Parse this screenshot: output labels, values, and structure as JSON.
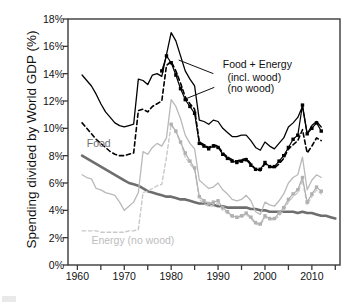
{
  "chart_data": {
    "type": "line",
    "title": "",
    "xlabel": "",
    "ylabel": "Spending divided by World GDP (%)",
    "xlim": [
      1958,
      2016
    ],
    "ylim": [
      0,
      18
    ],
    "y_tick_labels": [
      "0%",
      "2%",
      "4%",
      "6%",
      "8%",
      "10%",
      "12%",
      "14%",
      "16%",
      "18%"
    ],
    "y_tick_values": [
      0,
      2,
      4,
      6,
      8,
      10,
      12,
      14,
      16,
      18
    ],
    "x_tick_labels": [
      "1960",
      "1970",
      "1980",
      "1990",
      "2000",
      "2010"
    ],
    "x_tick_values": [
      1960,
      1970,
      1980,
      1990,
      2000,
      2010
    ],
    "x_minor_tick_values": [
      1965,
      1975,
      1985,
      1995,
      2005,
      2015
    ],
    "grid": false,
    "legend": "annotations-inline",
    "annotations": [
      {
        "name": "food-energy-title",
        "text": "Food + Energy",
        "x": 1991,
        "y": 14.6
      },
      {
        "name": "food-energy-incl-wood",
        "text": "(incl. wood)",
        "x": 1992,
        "y": 13.7
      },
      {
        "name": "food-energy-no-wood",
        "text": "(no wood)",
        "x": 1992,
        "y": 12.9
      },
      {
        "name": "food-label",
        "text": "Food",
        "x": 1962,
        "y": 8.9
      },
      {
        "name": "energy-no-wood-label",
        "text": "Energy (no wood)",
        "x": 1963,
        "y": 1.85
      }
    ],
    "series": [
      {
        "name": "Food + Energy (incl. wood)",
        "color": "#000000",
        "style": "solid",
        "width": 1.3,
        "markers": false,
        "x": [
          1961,
          1962,
          1963,
          1964,
          1965,
          1966,
          1967,
          1968,
          1969,
          1970,
          1971,
          1972,
          1973,
          1974,
          1975,
          1976,
          1977,
          1978,
          1979,
          1980,
          1981,
          1982,
          1983,
          1984,
          1985,
          1986,
          1987,
          1988,
          1989,
          1990,
          1991,
          1992,
          1993,
          1994,
          1995,
          1996,
          1997,
          1998,
          1999,
          2000,
          2001,
          2002,
          2003,
          2004,
          2005,
          2006,
          2007,
          2008,
          2009,
          2010,
          2011,
          2012
        ],
        "y": [
          13.9,
          13.5,
          13.1,
          12.5,
          11.8,
          11.2,
          10.8,
          10.4,
          10.2,
          10.1,
          10.2,
          10.3,
          13.6,
          13.5,
          13.2,
          13.9,
          14.0,
          13.8,
          15.4,
          17.0,
          16.4,
          15.3,
          14.2,
          13.6,
          13.1,
          10.6,
          10.5,
          10.3,
          10.6,
          10.5,
          10.0,
          9.7,
          9.4,
          9.4,
          9.5,
          9.5,
          9.1,
          8.6,
          8.4,
          9.0,
          8.7,
          8.5,
          8.9,
          9.3,
          10.1,
          10.4,
          10.8,
          11.6,
          9.6,
          10.2,
          10.5,
          10.1
        ]
      },
      {
        "name": "Food + Energy (no wood)",
        "color": "#000000",
        "style": "dashed",
        "width": 1.6,
        "markers": false,
        "x": [
          1961,
          1962,
          1963,
          1964,
          1965,
          1966,
          1967,
          1968,
          1969,
          1970,
          1971,
          1972,
          1973,
          1974,
          1975,
          1976,
          1977,
          1978,
          1979,
          1980,
          1981,
          1982,
          1983,
          1984,
          1985,
          1986,
          1987,
          1988,
          1989,
          1990,
          1991,
          1992,
          1993,
          1994,
          1995,
          1996,
          1997,
          1998,
          1999,
          2000,
          2001,
          2002,
          2003,
          2004,
          2005,
          2006,
          2007,
          2008,
          2009,
          2010,
          2011,
          2012
        ],
        "y": [
          10.4,
          10.0,
          9.6,
          9.2,
          8.9,
          8.6,
          8.3,
          8.1,
          8.0,
          8.0,
          8.1,
          8.2,
          11.3,
          11.4,
          11.2,
          11.6,
          11.8,
          12.0,
          14.6,
          14.9,
          14.2,
          13.3,
          12.3,
          11.8,
          11.4,
          9.0,
          8.8,
          8.6,
          8.8,
          8.7,
          8.2,
          7.9,
          7.7,
          7.6,
          7.7,
          7.8,
          7.4,
          7.0,
          6.9,
          7.4,
          7.2,
          7.1,
          7.4,
          7.8,
          8.5,
          8.8,
          9.1,
          9.9,
          8.2,
          8.7,
          9.3,
          9.1
        ]
      },
      {
        "name": "Food + Energy (no wood) markers",
        "color": "#000000",
        "style": "solid",
        "width": 1.2,
        "markers": true,
        "x": [
          1978,
          1979,
          1980,
          1981,
          1982,
          1983,
          1984,
          1985,
          1986,
          1987,
          1988,
          1989,
          1990,
          1991,
          1992,
          1993,
          1994,
          1995,
          1996,
          1997,
          1998,
          1999,
          2000,
          2001,
          2002,
          2003,
          2004,
          2005,
          2006,
          2007,
          2008,
          2009,
          2010,
          2011,
          2012
        ],
        "y": [
          14.2,
          15.3,
          14.8,
          13.9,
          12.9,
          12.1,
          11.6,
          11.1,
          8.9,
          8.7,
          8.5,
          8.7,
          8.6,
          8.1,
          7.8,
          7.6,
          7.5,
          7.6,
          7.7,
          7.3,
          7.0,
          7.0,
          7.5,
          7.2,
          7.2,
          7.6,
          8.0,
          8.6,
          9.2,
          9.5,
          11.7,
          9.6,
          10.0,
          10.4,
          9.8
        ]
      },
      {
        "name": "Food",
        "color": "#6e6e6e",
        "style": "solid",
        "width": 2.6,
        "markers": false,
        "x": [
          1961,
          1962,
          1963,
          1964,
          1965,
          1966,
          1967,
          1968,
          1969,
          1970,
          1971,
          1972,
          1973,
          1974,
          1975,
          1976,
          1977,
          1978,
          1979,
          1980,
          1981,
          1982,
          1983,
          1984,
          1985,
          1986,
          1987,
          1988,
          1989,
          1990,
          1991,
          1992,
          1993,
          1994,
          1995,
          1996,
          1997,
          1998,
          1999,
          2000,
          2001,
          2002,
          2003,
          2004,
          2005,
          2006,
          2007,
          2008,
          2009,
          2010,
          2011,
          2012,
          2013,
          2014,
          2015
        ],
        "y": [
          8.0,
          7.8,
          7.6,
          7.4,
          7.2,
          7.0,
          6.8,
          6.6,
          6.4,
          6.2,
          6.0,
          5.9,
          5.8,
          5.6,
          5.4,
          5.3,
          5.2,
          5.1,
          5.0,
          5.0,
          4.9,
          4.8,
          4.8,
          4.7,
          4.6,
          4.5,
          4.5,
          4.4,
          4.4,
          4.3,
          4.3,
          4.2,
          4.2,
          4.2,
          4.2,
          4.2,
          4.1,
          4.1,
          4.0,
          4.0,
          3.9,
          3.9,
          3.9,
          3.9,
          3.9,
          3.9,
          3.8,
          3.9,
          3.8,
          3.8,
          3.7,
          3.6,
          3.6,
          3.5,
          3.4
        ]
      },
      {
        "name": "Energy (incl. wood)",
        "color": "#b9b9b9",
        "style": "solid",
        "width": 1.3,
        "markers": false,
        "x": [
          1961,
          1962,
          1963,
          1964,
          1965,
          1966,
          1967,
          1968,
          1969,
          1970,
          1971,
          1972,
          1973,
          1974,
          1975,
          1976,
          1977,
          1978,
          1979,
          1980,
          1981,
          1982,
          1983,
          1984,
          1985,
          1986,
          1987,
          1988,
          1989,
          1990,
          1991,
          1992,
          1993,
          1994,
          1995,
          1996,
          1997,
          1998,
          1999,
          2000,
          2001,
          2002,
          2003,
          2004,
          2005,
          2006,
          2007,
          2008,
          2009,
          2010,
          2011,
          2012
        ],
        "y": [
          6.6,
          6.4,
          6.3,
          5.6,
          5.5,
          5.3,
          5.2,
          5.1,
          4.6,
          4.0,
          4.3,
          4.6,
          5.3,
          8.3,
          8.1,
          8.6,
          8.9,
          8.7,
          9.3,
          12.1,
          11.6,
          10.7,
          9.5,
          8.9,
          8.5,
          6.2,
          5.9,
          5.6,
          5.7,
          6.0,
          5.5,
          5.2,
          4.8,
          4.7,
          4.8,
          5.1,
          4.7,
          3.9,
          3.7,
          4.6,
          4.4,
          4.3,
          4.7,
          5.2,
          6.0,
          6.4,
          6.6,
          7.9,
          5.5,
          6.2,
          6.6,
          6.4
        ]
      },
      {
        "name": "Energy (no wood)",
        "color": "#c9c9c9",
        "style": "dashed",
        "width": 1.4,
        "markers": false,
        "x": [
          1961,
          1962,
          1963,
          1964,
          1965,
          1966,
          1967,
          1968,
          1969,
          1970,
          1971,
          1972,
          1973,
          1974,
          1975,
          1976,
          1977,
          1978,
          1979,
          1980,
          1981,
          1982,
          1983,
          1984,
          1985,
          1986,
          1987,
          1988,
          1989,
          1990,
          1991,
          1992,
          1993,
          1994,
          1995,
          1996,
          1997,
          1998,
          1999,
          2000,
          2001,
          2002,
          2003,
          2004,
          2005,
          2006,
          2007,
          2008,
          2009,
          2010,
          2011,
          2012
        ],
        "y": [
          2.5,
          2.5,
          2.5,
          2.5,
          2.4,
          2.4,
          2.4,
          2.4,
          2.4,
          2.4,
          2.5,
          2.5,
          2.6,
          5.3,
          5.4,
          5.6,
          5.8,
          5.9,
          7.9,
          10.3,
          9.7,
          9.0,
          7.9,
          7.4,
          7.0,
          4.8,
          4.5,
          4.3,
          4.4,
          4.5,
          4.0,
          3.8,
          3.5,
          3.4,
          3.5,
          3.7,
          3.4,
          3.0,
          2.9,
          3.5,
          3.3,
          3.3,
          3.6,
          4.0,
          4.6,
          5.0,
          5.3,
          6.2,
          4.4,
          5.0,
          5.5,
          5.2
        ]
      },
      {
        "name": "Energy (incl. wood) markers",
        "color": "#b0b0b0",
        "style": "solid",
        "width": 1.2,
        "markers": true,
        "x": [
          1980,
          1981,
          1982,
          1983,
          1984,
          1985,
          1986,
          1987,
          1988,
          1989,
          1990,
          1991,
          1992,
          1993,
          1994,
          1995,
          1996,
          1997,
          1998,
          1999,
          2000,
          2001,
          2002,
          2003,
          2004,
          2005,
          2006,
          2007,
          2008,
          2009,
          2010,
          2011,
          2012
        ],
        "y": [
          10.3,
          9.8,
          9.0,
          8.2,
          7.6,
          7.1,
          5.0,
          4.7,
          4.5,
          4.6,
          4.7,
          4.2,
          3.9,
          3.6,
          3.5,
          3.6,
          3.8,
          3.5,
          3.1,
          3.0,
          3.6,
          3.4,
          3.4,
          3.8,
          4.2,
          4.8,
          5.2,
          5.5,
          6.4,
          4.6,
          5.2,
          5.7,
          5.4
        ]
      }
    ]
  }
}
